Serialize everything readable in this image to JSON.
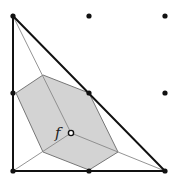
{
  "diagram": {
    "label_f": "f",
    "colors": {
      "hexagon_fill": "#d3d3d3",
      "hexagon_stroke": "#777777",
      "thin_line": "#888888",
      "thick_line": "#111111",
      "dot": "#111111"
    },
    "grid_points": [
      [
        13,
        16
      ],
      [
        89,
        16
      ],
      [
        165,
        16
      ],
      [
        13,
        93
      ],
      [
        89,
        93
      ],
      [
        165,
        93
      ],
      [
        13,
        171
      ],
      [
        89,
        171
      ],
      [
        165,
        171
      ]
    ],
    "triangle": [
      [
        13,
        16
      ],
      [
        165,
        171
      ],
      [
        13,
        171
      ]
    ],
    "hexagon": [
      [
        16,
        93
      ],
      [
        43,
        75
      ],
      [
        89,
        93
      ],
      [
        118,
        152
      ],
      [
        89,
        170
      ],
      [
        43,
        152
      ]
    ],
    "center": [
      71,
      133
    ]
  }
}
